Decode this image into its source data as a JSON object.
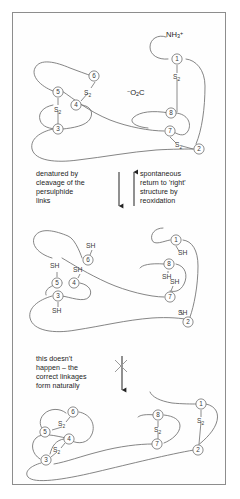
{
  "figure": {
    "border_color": "#8d8d8d",
    "chain_color": "#6f6f6f",
    "text_color": "#1b1b1b"
  },
  "termini": {
    "n_terminus": "NH3+",
    "n_terminus_parts": {
      "base": "NH",
      "sub": "3",
      "sup": "+"
    },
    "c_terminus": "-O2C",
    "c_terminus_parts": {
      "sup": "−",
      "base1": "O",
      "sub": "2",
      "base2": "C"
    }
  },
  "annotations": {
    "denature": "denatured by\ncleavage of the\npersulphide\nlinks",
    "reoxidize": "spontaneous\nreturn to 'right'\nstructure by\nreoxidation",
    "no_happen": "this doesn't\nhappen – the\ncorrect linkages\nform naturally"
  },
  "arrows": [
    {
      "name": "arrow-denature",
      "direction": "down",
      "crossed": false
    },
    {
      "name": "arrow-reoxidize",
      "direction": "up",
      "crossed": false
    },
    {
      "name": "arrow-incorrect",
      "direction": "down",
      "crossed": true
    }
  ],
  "panels": [
    {
      "id": "native",
      "name": "native-folded-protein",
      "state": "folded with correct disulphide bridges",
      "residues": [
        {
          "label": "1",
          "x": 177,
          "y": 59
        },
        {
          "label": "2",
          "x": 199,
          "y": 149
        },
        {
          "label": "3",
          "x": 58,
          "y": 129
        },
        {
          "label": "4",
          "x": 76,
          "y": 105
        },
        {
          "label": "5",
          "x": 58,
          "y": 92
        },
        {
          "label": "6",
          "x": 94,
          "y": 76
        },
        {
          "label": "7",
          "x": 170,
          "y": 131
        },
        {
          "label": "8",
          "x": 168,
          "y": 118
        }
      ],
      "bonds": [
        {
          "from": "1",
          "to": "8",
          "label": "S2"
        },
        {
          "from": "7",
          "to": "2",
          "label": "S2"
        },
        {
          "from": "6",
          "to": "4",
          "label": "S2"
        },
        {
          "from": "5",
          "to": "3",
          "label": "S2"
        }
      ],
      "bond_label_parts": {
        "base": "S",
        "sub": "2"
      }
    },
    {
      "id": "denatured",
      "name": "denatured-reduced-protein",
      "state": "unfolded with free thiol groups",
      "thiol_label": "SH",
      "residues": [
        {
          "label": "1",
          "x": 176,
          "y": 240
        },
        {
          "label": "2",
          "x": 188,
          "y": 322
        },
        {
          "label": "3",
          "x": 58,
          "y": 296
        },
        {
          "label": "4",
          "x": 74,
          "y": 283
        },
        {
          "label": "5",
          "x": 57,
          "y": 283
        },
        {
          "label": "6",
          "x": 88,
          "y": 260
        },
        {
          "label": "7",
          "x": 170,
          "y": 297
        },
        {
          "label": "8",
          "x": 169,
          "y": 264
        }
      ],
      "thiols": [
        {
          "residue": "1",
          "x": 178,
          "y": 253
        },
        {
          "residue": "2",
          "x": 180,
          "y": 313
        },
        {
          "residue": "3",
          "x": 59,
          "y": 309
        },
        {
          "residue": "4",
          "x": 79,
          "y": 273
        },
        {
          "residue": "5",
          "x": 57,
          "y": 269
        },
        {
          "residue": "6",
          "x": 93,
          "y": 248
        },
        {
          "residue": "7",
          "x": 172,
          "y": 282
        },
        {
          "residue": "8",
          "x": 169,
          "y": 277
        }
      ]
    },
    {
      "id": "scrambled",
      "name": "incorrectly-paired-protein",
      "state": "misfolded with wrong disulphide bridges",
      "residues": [
        {
          "label": "1",
          "x": 201,
          "y": 404
        },
        {
          "label": "2",
          "x": 198,
          "y": 450
        },
        {
          "label": "3",
          "x": 46,
          "y": 460
        },
        {
          "label": "4",
          "x": 69,
          "y": 439
        },
        {
          "label": "5",
          "x": 45,
          "y": 432
        },
        {
          "label": "6",
          "x": 73,
          "y": 412
        },
        {
          "label": "7",
          "x": 157,
          "y": 444
        },
        {
          "label": "8",
          "x": 158,
          "y": 415
        }
      ],
      "bonds": [
        {
          "from": "6",
          "to": "5",
          "label": "S2"
        },
        {
          "from": "4",
          "to": "3",
          "label": "S2"
        },
        {
          "from": "8",
          "to": "7",
          "label": "S2"
        },
        {
          "from": "1",
          "to": "2",
          "label": "S2"
        }
      ],
      "bond_label_parts": {
        "base": "S",
        "sub": "2"
      }
    }
  ]
}
